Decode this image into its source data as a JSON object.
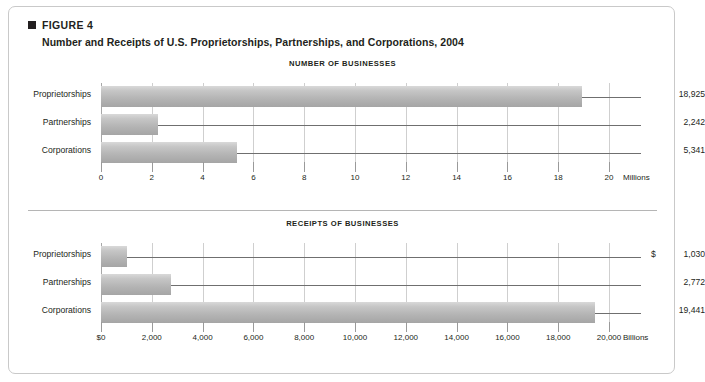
{
  "figure": {
    "kicker": "FIGURE 4",
    "title": "Number and Receipts of U.S. Proprietorships, Partnerships, and Corporations, 2004",
    "marker_color": "#231f20",
    "bar_color": "#b4b4b4",
    "grid_color": "#cfcfcf"
  },
  "chart_data": [
    {
      "type": "bar",
      "orientation": "horizontal",
      "title": "NUMBER OF BUSINESSES",
      "categories": [
        "Proprietorships",
        "Partnerships",
        "Corporations"
      ],
      "values": [
        18925,
        2242,
        5341
      ],
      "value_labels": [
        "18,925",
        "2,242",
        "5,341"
      ],
      "currency_prefixes": [
        "",
        "",
        ""
      ],
      "bar_scale_divisor": 1000,
      "xlabel": "",
      "ylabel": "",
      "unit": "Millions",
      "xlim": [
        0,
        20
      ],
      "xticks": [
        0,
        2,
        4,
        6,
        8,
        10,
        12,
        14,
        16,
        18,
        20
      ],
      "xticklabels": [
        "0",
        "2",
        "4",
        "6",
        "8",
        "10",
        "12",
        "14",
        "16",
        "18",
        "20"
      ],
      "grid": true,
      "legend": "none"
    },
    {
      "type": "bar",
      "orientation": "horizontal",
      "title": "RECEIPTS OF BUSINESSES",
      "categories": [
        "Proprietorships",
        "Partnerships",
        "Corporations"
      ],
      "values": [
        1030,
        2772,
        19441
      ],
      "value_labels": [
        "1,030",
        "2,772",
        "19,441"
      ],
      "currency_prefixes": [
        "$",
        "",
        ""
      ],
      "bar_scale_divisor": 1,
      "xlabel": "",
      "ylabel": "",
      "unit": "Billions",
      "xlim": [
        0,
        20000
      ],
      "xticks": [
        0,
        2000,
        4000,
        6000,
        8000,
        10000,
        12000,
        14000,
        16000,
        18000,
        20000
      ],
      "xticklabels": [
        "$0",
        "2,000",
        "4,000",
        "6,000",
        "8,000",
        "10,000",
        "12,000",
        "14,000",
        "16,000",
        "18,000",
        "20,000"
      ],
      "grid": true,
      "legend": "none"
    }
  ]
}
